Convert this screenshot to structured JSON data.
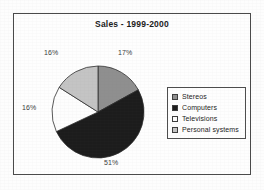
{
  "chart_data": {
    "type": "pie",
    "title": "Sales - 1999-2000",
    "xlabel": "",
    "ylabel": "",
    "legend_position": "right",
    "grid": false,
    "categories": [
      "Stereos",
      "Computers",
      "Televisions",
      "Personal systems"
    ],
    "values": [
      17,
      51,
      16,
      16
    ],
    "value_labels": [
      "17%",
      "51%",
      "16%",
      "16%"
    ],
    "colors": [
      "#8f8f8f",
      "#1c1c1c",
      "#fdfdfd",
      "#c4c4c4"
    ],
    "slices": [
      {
        "name": "Stereos",
        "percent": 17,
        "label": "17%",
        "color": "#8f8f8f",
        "start_deg": 0,
        "end_deg": 61.2
      },
      {
        "name": "Computers",
        "percent": 51,
        "label": "51%",
        "color": "#1c1c1c",
        "start_deg": 61.2,
        "end_deg": 244.8
      },
      {
        "name": "Televisions",
        "percent": 16,
        "label": "16%",
        "color": "#fdfdfd",
        "start_deg": 244.8,
        "end_deg": 302.4
      },
      {
        "name": "Personal systems",
        "percent": 16,
        "label": "16%",
        "color": "#c4c4c4",
        "start_deg": 302.4,
        "end_deg": 360
      }
    ]
  },
  "chart": {
    "title": "Sales - 1999-2000",
    "labels": {
      "stereos": "17%",
      "computers": "51%",
      "televisions": "16%",
      "personal_systems": "16%"
    }
  },
  "legend": {
    "items": [
      {
        "label": "Stereos",
        "color": "#8f8f8f"
      },
      {
        "label": "Computers",
        "color": "#1c1c1c"
      },
      {
        "label": "Televisions",
        "color": "#fdfdfd"
      },
      {
        "label": "Personal systems",
        "color": "#c4c4c4"
      }
    ]
  }
}
